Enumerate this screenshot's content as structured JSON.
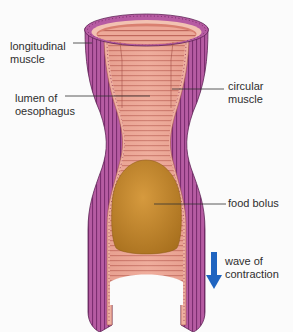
{
  "diagram": {
    "labels": {
      "longitudinal_muscle": "longitudinal\nmuscle",
      "lumen": "lumen of\noesophagus",
      "circular_muscle": "circular\nmuscle",
      "food_bolus": "food bolus",
      "wave": "wave of\ncontraction"
    },
    "colors": {
      "longitudinal_muscle": "#b4579f",
      "longitudinal_stripe": "#7e2f72",
      "circular_muscle": "#e8a494",
      "circular_ring": "#c56a5f",
      "lumen_inner": "#f0b8a6",
      "food_bolus": "#c98a2c",
      "arrow": "#1f64c0",
      "leader_line": "#333333"
    },
    "arrow": {
      "direction": "down"
    }
  }
}
